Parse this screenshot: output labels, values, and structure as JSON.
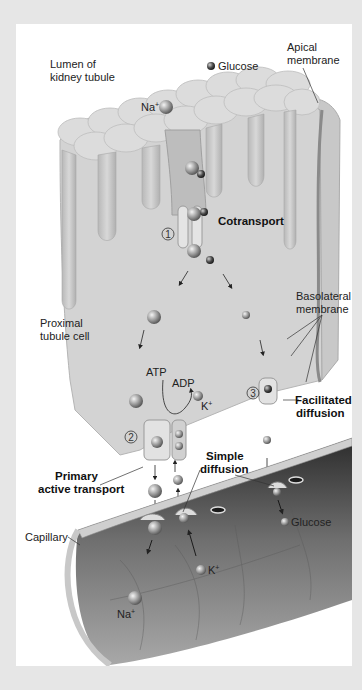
{
  "diagram": {
    "title_region": {
      "lumen_label": [
        "Lumen of",
        "kidney tubule"
      ],
      "apical_label": [
        "Apical",
        "membrane"
      ],
      "cell_label": [
        "Proximal",
        "tubule cell"
      ],
      "basolateral_label": [
        "Basolateral",
        "membrane"
      ],
      "capillary_label": "Capillary"
    },
    "molecules": {
      "glucose_top": "Glucose",
      "na_top": "Na",
      "na_sup": "+",
      "glucose_bottom": "Glucose",
      "k_bottom": "K",
      "k_sup": "+",
      "na_bottom": "Na",
      "na_bottom_sup": "+",
      "k_pump": "K",
      "k_pump_sup": "+",
      "atp": "ATP",
      "adp": "ADP"
    },
    "processes": [
      {
        "number": "1",
        "label": "Cotransport"
      },
      {
        "number": "2",
        "label": [
          "Primary",
          "active transport"
        ]
      },
      {
        "number": "3",
        "label": [
          "Facilitated",
          "diffusion"
        ]
      },
      {
        "number": "",
        "label": [
          "Simple",
          "diffusion"
        ]
      }
    ],
    "colors": {
      "background": "#e6e6e6",
      "panel": "#ffffff",
      "cell_fill": "#d6d6d6",
      "microvilli": "#c4c4c4",
      "capillary_dark": "#3a3a3a",
      "capillary_mid": "#8a8a8a",
      "text": "#222222"
    }
  }
}
